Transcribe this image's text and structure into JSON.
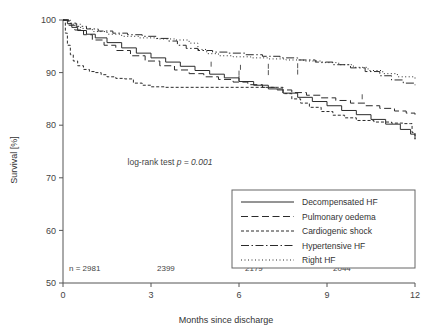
{
  "chart_data": {
    "type": "line",
    "title": "",
    "subtitle": "",
    "xlabel": "Months since discharge",
    "ylabel": "Survival [%]",
    "xlim": [
      0,
      12
    ],
    "ylim": [
      50,
      100
    ],
    "xticks": [
      0,
      3,
      6,
      9,
      12
    ],
    "xtick_labels": [
      "0",
      "3",
      "6",
      "9",
      "12"
    ],
    "yticks": [
      50,
      60,
      70,
      80,
      90,
      100
    ],
    "ytick_labels": [
      "50",
      "60",
      "70",
      "80",
      "90",
      "100"
    ],
    "grid": false,
    "legend_position": "bottom-right",
    "annotations": [
      {
        "name": "log-rank-annotation",
        "prefix": "log-rank test ",
        "italic": "p = 0.001",
        "x": 2.2,
        "y": 72.5
      }
    ],
    "at_risk": {
      "label_prefix": "n = ",
      "times": [
        0,
        3,
        6,
        9
      ],
      "counts": [
        "2981",
        "2399",
        "2179",
        "2044"
      ]
    },
    "series": [
      {
        "name": "Decompensated HF",
        "dash": "solid",
        "dasharray": "none",
        "points": [
          [
            0,
            100
          ],
          [
            0.15,
            99.3
          ],
          [
            0.3,
            98.6
          ],
          [
            0.5,
            98.0
          ],
          [
            0.8,
            97.3
          ],
          [
            1.1,
            96.6
          ],
          [
            1.5,
            95.7
          ],
          [
            2.0,
            94.7
          ],
          [
            2.5,
            93.7
          ],
          [
            3.0,
            92.8
          ],
          [
            3.5,
            92.0
          ],
          [
            4.0,
            91.2
          ],
          [
            4.5,
            90.4
          ],
          [
            5.0,
            89.7
          ],
          [
            5.5,
            89.0
          ],
          [
            6.0,
            88.3
          ],
          [
            6.5,
            87.6
          ],
          [
            7.0,
            86.9
          ],
          [
            7.5,
            86.1
          ],
          [
            8.0,
            85.3
          ],
          [
            8.5,
            84.5
          ],
          [
            9.0,
            83.7
          ],
          [
            9.5,
            82.8
          ],
          [
            10.0,
            82.0
          ],
          [
            10.5,
            81.1
          ],
          [
            11.0,
            80.2
          ],
          [
            11.5,
            79.2
          ],
          [
            11.85,
            78.3
          ],
          [
            12,
            77.3
          ]
        ]
      },
      {
        "name": "Pulmonary oedema",
        "dash": "dashed-long",
        "dasharray": "7,3.5",
        "points": [
          [
            0,
            100
          ],
          [
            0.2,
            99.0
          ],
          [
            0.4,
            98.1
          ],
          [
            0.7,
            97.2
          ],
          [
            1.0,
            96.2
          ],
          [
            1.4,
            95.2
          ],
          [
            1.8,
            94.2
          ],
          [
            2.3,
            93.2
          ],
          [
            2.8,
            92.2
          ],
          [
            3.3,
            91.3
          ],
          [
            3.8,
            90.5
          ],
          [
            4.3,
            89.8
          ],
          [
            4.8,
            89.2
          ],
          [
            5.3,
            88.7
          ],
          [
            5.8,
            88.2
          ],
          [
            6.3,
            87.7
          ],
          [
            6.8,
            87.2
          ],
          [
            7.3,
            86.7
          ],
          [
            7.8,
            86.2
          ],
          [
            8.3,
            85.7
          ],
          [
            8.8,
            85.2
          ],
          [
            9.3,
            84.7
          ],
          [
            9.8,
            84.2
          ],
          [
            10.3,
            83.7
          ],
          [
            10.8,
            83.2
          ],
          [
            11.3,
            82.7
          ],
          [
            11.7,
            82.3
          ],
          [
            12,
            82.0
          ]
        ]
      },
      {
        "name": "Cardiogenic shock",
        "dash": "dashed-short",
        "dasharray": "3,2",
        "points": [
          [
            0,
            100
          ],
          [
            0.08,
            97.5
          ],
          [
            0.15,
            95.2
          ],
          [
            0.25,
            93.4
          ],
          [
            0.35,
            92.2
          ],
          [
            0.5,
            91.3
          ],
          [
            0.7,
            90.6
          ],
          [
            0.9,
            90.2
          ],
          [
            1.1,
            90.0
          ],
          [
            1.3,
            89.6
          ],
          [
            1.5,
            89.2
          ],
          [
            1.8,
            88.9
          ],
          [
            2.1,
            88.8
          ],
          [
            2.4,
            88.0
          ],
          [
            2.7,
            87.6
          ],
          [
            3.0,
            87.3
          ],
          [
            3.5,
            87.2
          ],
          [
            4.5,
            87.2
          ],
          [
            5.5,
            87.2
          ],
          [
            6.5,
            87.2
          ],
          [
            7.3,
            87.2
          ],
          [
            7.5,
            86.0
          ],
          [
            7.8,
            85.0
          ],
          [
            8.1,
            84.2
          ],
          [
            8.4,
            83.4
          ],
          [
            8.8,
            82.6
          ],
          [
            9.2,
            81.9
          ],
          [
            9.6,
            81.4
          ],
          [
            10.0,
            80.9
          ],
          [
            10.6,
            80.6
          ],
          [
            11.2,
            80.4
          ],
          [
            11.6,
            80.3
          ],
          [
            11.85,
            80.3
          ],
          [
            11.9,
            78.6
          ],
          [
            12,
            77.4
          ]
        ]
      },
      {
        "name": "Hypertensive HF",
        "dash": "dash-dot",
        "dasharray": "8,2.5,1.5,2.5",
        "points": [
          [
            0,
            100
          ],
          [
            0.2,
            99.4
          ],
          [
            0.45,
            98.8
          ],
          [
            0.8,
            98.3
          ],
          [
            1.2,
            97.9
          ],
          [
            1.7,
            97.5
          ],
          [
            2.2,
            97.2
          ],
          [
            2.7,
            96.9
          ],
          [
            3.2,
            96.5
          ],
          [
            3.6,
            96.0
          ],
          [
            3.9,
            95.2
          ],
          [
            4.2,
            94.6
          ],
          [
            4.6,
            94.2
          ],
          [
            5.1,
            93.9
          ],
          [
            5.6,
            93.7
          ],
          [
            6.2,
            93.4
          ],
          [
            6.8,
            93.1
          ],
          [
            7.4,
            92.8
          ],
          [
            8.0,
            92.4
          ],
          [
            8.6,
            92.0
          ],
          [
            9.2,
            91.5
          ],
          [
            9.8,
            90.9
          ],
          [
            10.3,
            90.2
          ],
          [
            10.8,
            89.4
          ],
          [
            11.2,
            88.6
          ],
          [
            11.6,
            88.0
          ],
          [
            12,
            87.6
          ]
        ]
      },
      {
        "name": "Right HF",
        "dash": "dotted",
        "dasharray": "1,2.5",
        "points": [
          [
            0,
            100
          ],
          [
            0.25,
            99.2
          ],
          [
            0.6,
            98.4
          ],
          [
            1.0,
            97.8
          ],
          [
            1.5,
            97.3
          ],
          [
            2.0,
            96.9
          ],
          [
            2.6,
            96.6
          ],
          [
            3.2,
            96.4
          ],
          [
            3.8,
            96.2
          ],
          [
            4.3,
            95.6
          ],
          [
            4.6,
            94.4
          ],
          [
            4.9,
            93.6
          ],
          [
            5.3,
            93.2
          ],
          [
            5.8,
            93.0
          ],
          [
            6.4,
            92.8
          ],
          [
            7.0,
            92.6
          ],
          [
            7.6,
            92.4
          ],
          [
            8.2,
            92.2
          ],
          [
            8.8,
            91.9
          ],
          [
            9.4,
            91.5
          ],
          [
            9.9,
            91.0
          ],
          [
            10.4,
            90.4
          ],
          [
            10.9,
            89.8
          ],
          [
            11.4,
            89.2
          ],
          [
            12,
            88.8
          ]
        ]
      }
    ],
    "scatter_marks": [
      {
        "x": 5.05,
        "y": 91.6
      },
      {
        "x": 6.05,
        "y": 91.0
      },
      {
        "x": 6.0,
        "y": 89.9
      },
      {
        "x": 6.0,
        "y": 88.9
      },
      {
        "x": 7.0,
        "y": 91.2
      },
      {
        "x": 7.0,
        "y": 90.0
      },
      {
        "x": 8.0,
        "y": 91.3
      },
      {
        "x": 8.0,
        "y": 90.1
      },
      {
        "x": 10.2,
        "y": 85.4
      }
    ]
  },
  "legend": {
    "entries": [
      {
        "label": "Decompensated HF",
        "dasharray": "none"
      },
      {
        "label": "Pulmonary oedema",
        "dasharray": "7,3.5"
      },
      {
        "label": "Cardiogenic shock",
        "dasharray": "3,2"
      },
      {
        "label": "Hypertensive HF",
        "dasharray": "8,2.5,1.5,2.5"
      },
      {
        "label": "Right HF",
        "dasharray": "1,2.5"
      }
    ]
  },
  "colors": {
    "line": "#2b2b2b",
    "axis": "#555555",
    "text": "#333333",
    "background": "#ffffff"
  }
}
